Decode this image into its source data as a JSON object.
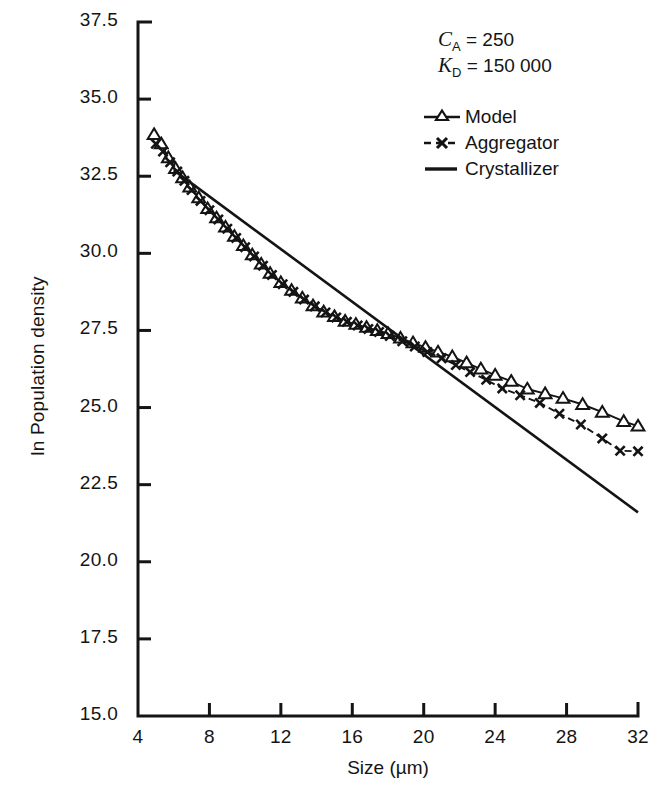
{
  "annotations": {
    "ca_symbol": "C",
    "ca_sub": "A",
    "ca_eq": " = ",
    "ca_value": "250",
    "kd_symbol": "K",
    "kd_sub": "D",
    "kd_eq": " = ",
    "kd_value": "150 000"
  },
  "legend": {
    "items": [
      {
        "label": "Model",
        "marker": "triangle-up-open",
        "line": "solid"
      },
      {
        "label": "Aggregator",
        "marker": "cross-x",
        "line": "dashed"
      },
      {
        "label": "Crystallizer",
        "marker": "none",
        "line": "solid"
      }
    ]
  },
  "chart_data": {
    "type": "line",
    "title": "",
    "xlabel": "Size (µm)",
    "ylabel": "ln Population density",
    "xlim": [
      4,
      32
    ],
    "ylim": [
      15.0,
      37.5
    ],
    "xticks": [
      4,
      8,
      12,
      16,
      20,
      24,
      28,
      32
    ],
    "yticks": [
      15.0,
      17.5,
      20.0,
      22.5,
      25.0,
      27.5,
      30.0,
      32.5,
      35.0,
      37.5
    ],
    "ytick_labels": [
      "15.0",
      "17.5",
      "20.0",
      "22.5",
      "25.0",
      "27.5",
      "30.0",
      "32.5",
      "35.0",
      "37.5"
    ],
    "xtick_labels": [
      "4",
      "8",
      "12",
      "16",
      "20",
      "24",
      "28",
      "32"
    ],
    "grid": false,
    "legend_position": "upper right",
    "series": [
      {
        "name": "Model",
        "marker": "triangle-up-open",
        "line": "solid",
        "x": [
          4.9,
          5.3,
          5.7,
          6.1,
          6.5,
          6.9,
          7.4,
          7.9,
          8.4,
          8.9,
          9.4,
          9.9,
          10.4,
          10.9,
          11.4,
          12.0,
          12.6,
          13.2,
          13.8,
          14.4,
          15.0,
          15.6,
          16.2,
          16.8,
          17.4,
          18.0,
          18.7,
          19.4,
          20.1,
          20.8,
          21.6,
          22.4,
          23.2,
          24.0,
          24.9,
          25.8,
          26.8,
          27.8,
          28.9,
          30.0,
          31.2,
          32.0
        ],
        "y": [
          33.85,
          33.55,
          33.1,
          32.75,
          32.45,
          32.15,
          31.8,
          31.45,
          31.15,
          30.85,
          30.55,
          30.25,
          29.95,
          29.65,
          29.35,
          29.05,
          28.8,
          28.55,
          28.3,
          28.1,
          27.95,
          27.8,
          27.7,
          27.6,
          27.5,
          27.4,
          27.25,
          27.1,
          26.95,
          26.8,
          26.65,
          26.45,
          26.25,
          26.05,
          25.85,
          25.6,
          25.45,
          25.3,
          25.1,
          24.85,
          24.55,
          24.4
        ]
      },
      {
        "name": "Aggregator",
        "marker": "cross-x",
        "line": "dashed",
        "x": [
          5.0,
          5.4,
          5.8,
          6.2,
          6.6,
          7.0,
          7.5,
          8.0,
          8.5,
          9.0,
          9.5,
          10.0,
          10.5,
          11.0,
          11.5,
          12.1,
          12.7,
          13.3,
          13.9,
          14.5,
          15.1,
          15.7,
          16.3,
          16.9,
          17.5,
          18.1,
          18.8,
          19.5,
          20.2,
          21.0,
          21.8,
          22.6,
          23.5,
          24.4,
          25.4,
          26.5,
          27.6,
          28.8,
          30.0,
          31.0,
          32.0
        ],
        "y": [
          33.55,
          33.3,
          32.95,
          32.65,
          32.35,
          32.05,
          31.7,
          31.4,
          31.1,
          30.8,
          30.5,
          30.2,
          29.9,
          29.6,
          29.3,
          29.0,
          28.75,
          28.5,
          28.28,
          28.08,
          27.92,
          27.78,
          27.66,
          27.55,
          27.45,
          27.32,
          27.15,
          26.98,
          26.8,
          26.6,
          26.38,
          26.15,
          25.9,
          25.62,
          25.4,
          25.15,
          24.8,
          24.45,
          24.0,
          23.6,
          23.58
        ]
      },
      {
        "name": "Crystallizer",
        "marker": "none",
        "line": "solid",
        "x": [
          6.0,
          32.0
        ],
        "y": [
          32.7,
          21.6
        ]
      }
    ]
  }
}
